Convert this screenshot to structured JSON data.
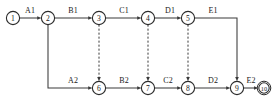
{
  "diagram": {
    "type": "activity-on-arrow-network",
    "nodes": [
      {
        "id": "1",
        "label": "1",
        "x": 13,
        "y": 18,
        "r": 6.6,
        "style": "single"
      },
      {
        "id": "2",
        "label": "2",
        "x": 48,
        "y": 18,
        "r": 6.6,
        "style": "single"
      },
      {
        "id": "3",
        "label": "3",
        "x": 99,
        "y": 18,
        "r": 6.6,
        "style": "single"
      },
      {
        "id": "4",
        "label": "4",
        "x": 148,
        "y": 18,
        "r": 6.6,
        "style": "single"
      },
      {
        "id": "5",
        "label": "5",
        "x": 188,
        "y": 18,
        "r": 6.6,
        "style": "single"
      },
      {
        "id": "6",
        "label": "6",
        "x": 99,
        "y": 88,
        "r": 6.6,
        "style": "single"
      },
      {
        "id": "7",
        "label": "7",
        "x": 148,
        "y": 88,
        "r": 6.6,
        "style": "single"
      },
      {
        "id": "8",
        "label": "8",
        "x": 188,
        "y": 88,
        "r": 6.6,
        "style": "single"
      },
      {
        "id": "9",
        "label": "9",
        "x": 237,
        "y": 88,
        "r": 6.6,
        "style": "single"
      },
      {
        "id": "10",
        "label": "10",
        "x": 264,
        "y": 88,
        "r": 6.6,
        "style": "double"
      }
    ],
    "edges": [
      {
        "id": "A1",
        "label": "A1",
        "from": "1",
        "to": "2",
        "kind": "solid",
        "label_x": 30,
        "label_y": 13
      },
      {
        "id": "B1",
        "label": "B1",
        "from": "2",
        "to": "3",
        "kind": "solid",
        "label_x": 73,
        "label_y": 13
      },
      {
        "id": "C1",
        "label": "C1",
        "from": "3",
        "to": "4",
        "kind": "solid",
        "label_x": 124,
        "label_y": 13
      },
      {
        "id": "D1",
        "label": "D1",
        "from": "4",
        "to": "5",
        "kind": "solid",
        "label_x": 170,
        "label_y": 13
      },
      {
        "id": "E1",
        "label": "E1",
        "from": "5",
        "to": "9",
        "kind": "elbow",
        "label_x": 213,
        "label_y": 13
      },
      {
        "id": "A2",
        "label": "A2",
        "from": "2",
        "to": "6",
        "kind": "elbow",
        "label_x": 73,
        "label_y": 83
      },
      {
        "id": "B2",
        "label": "B2",
        "from": "6",
        "to": "7",
        "kind": "solid",
        "label_x": 124,
        "label_y": 83
      },
      {
        "id": "C2",
        "label": "C2",
        "from": "7",
        "to": "8",
        "kind": "solid",
        "label_x": 168,
        "label_y": 83
      },
      {
        "id": "D2",
        "label": "D2",
        "from": "8",
        "to": "9",
        "kind": "solid",
        "label_x": 213,
        "label_y": 83
      },
      {
        "id": "E2",
        "label": "E2",
        "from": "9",
        "to": "10",
        "kind": "solid",
        "label_x": 251,
        "label_y": 83
      }
    ],
    "dummy_edges": [
      {
        "id": "dummy-3-6",
        "from": "3",
        "to": "6",
        "kind": "dashed"
      },
      {
        "id": "dummy-4-7",
        "from": "4",
        "to": "7",
        "kind": "dashed"
      },
      {
        "id": "dummy-5-8",
        "from": "5",
        "to": "8",
        "kind": "dashed"
      }
    ],
    "colors": {
      "stroke": "#3a3a3a",
      "node_stroke": "#2b2b2b",
      "text": "#1a1a1a",
      "background": "#ffffff"
    }
  }
}
